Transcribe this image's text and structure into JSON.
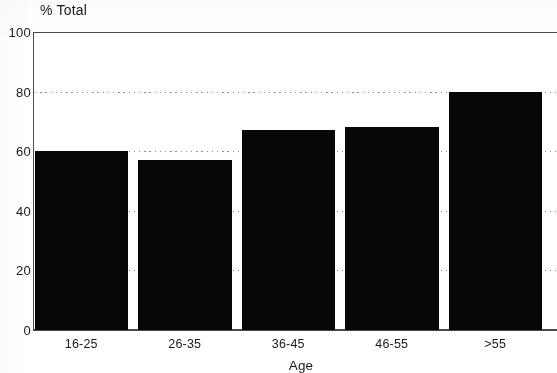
{
  "chart_data": {
    "type": "bar",
    "title": "",
    "categories": [
      "16-25",
      "26-35",
      "36-45",
      "46-55",
      ">55"
    ],
    "values": [
      60,
      57,
      67,
      68,
      80
    ],
    "series": [
      {
        "name": "% Total",
        "values": [
          60,
          57,
          67,
          68,
          80
        ]
      }
    ],
    "xlabel": "Age",
    "ylabel": "% Total",
    "ylim": [
      0,
      100
    ],
    "yticks": [
      0,
      20,
      40,
      60,
      80,
      100
    ],
    "ytick_labels": [
      "0",
      "20",
      "40",
      "60",
      "80",
      "100"
    ],
    "gridlines": [
      20,
      40,
      60,
      80
    ],
    "grid": true,
    "legend": false,
    "legend_position": "none",
    "bar_color": "#070707",
    "axis_color": "#4a4a4a",
    "grid_color": "#8d8d8d",
    "background_color": "#ffffff"
  },
  "axes": {
    "y_title": "% Total",
    "x_title": "Age"
  }
}
